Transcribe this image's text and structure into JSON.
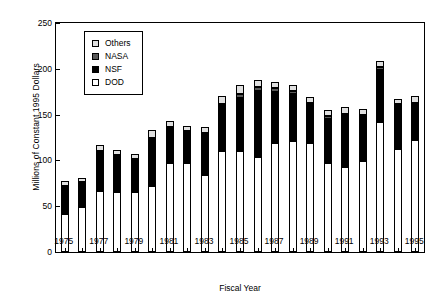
{
  "chart_data": {
    "type": "bar",
    "stacked": true,
    "title": "",
    "xlabel": "Fiscal Year",
    "ylabel": "Millions of Constant 1995 Dollars",
    "ylim": [
      0,
      250
    ],
    "yticks": [
      0,
      50,
      100,
      150,
      200,
      250
    ],
    "grid": false,
    "legend_position": "upper-left-inside",
    "categories": [
      "1975",
      "1976",
      "1977",
      "1978",
      "1979",
      "1980",
      "1981",
      "1982",
      "1983",
      "1984",
      "1985",
      "1986",
      "1987",
      "1988",
      "1989",
      "1990",
      "1991",
      "1992",
      "1993",
      "1994",
      "1995"
    ],
    "xtick_labels": [
      "1975",
      "1977",
      "1979",
      "1981",
      "1983",
      "1985",
      "1987",
      "1989",
      "1991",
      "1993",
      "1995"
    ],
    "series": [
      {
        "name": "DOD",
        "color": "#ffffff",
        "values": [
          41,
          49,
          67,
          66,
          66,
          72,
          97,
          97,
          84,
          110,
          110,
          104,
          119,
          121,
          119,
          97,
          93,
          99,
          142,
          113,
          122
        ]
      },
      {
        "name": "NSF",
        "color": "#000000",
        "values": [
          30,
          26,
          42,
          39,
          34,
          51,
          38,
          33,
          44,
          49,
          58,
          72,
          56,
          52,
          41,
          48,
          55,
          48,
          57,
          46,
          38
        ]
      },
      {
        "name": "NASA",
        "color": "#595959",
        "values": [
          1,
          1,
          1,
          1,
          1,
          2,
          2,
          2,
          2,
          3,
          4,
          4,
          4,
          3,
          3,
          3,
          3,
          3,
          3,
          3,
          3
        ]
      },
      {
        "name": "Others",
        "color": "#e0e0e0",
        "values": [
          5,
          5,
          7,
          5,
          6,
          8,
          6,
          6,
          6,
          8,
          10,
          8,
          7,
          6,
          6,
          7,
          7,
          6,
          6,
          5,
          7
        ]
      }
    ],
    "totals": [
      77,
      81,
      117,
      111,
      107,
      133,
      143,
      138,
      136,
      170,
      182,
      188,
      186,
      182,
      169,
      155,
      158,
      156,
      208,
      167,
      170
    ]
  },
  "legend": {
    "entries": [
      {
        "label": "Others"
      },
      {
        "label": "NASA"
      },
      {
        "label": "NSF"
      },
      {
        "label": "DOD"
      }
    ]
  }
}
